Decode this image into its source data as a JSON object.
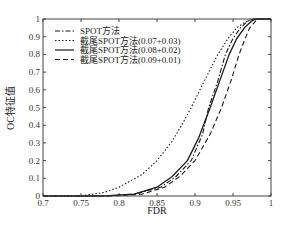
{
  "chart_data": {
    "type": "line",
    "title": "",
    "xlabel": "FDR",
    "ylabel": "OC特征值",
    "xlim": [
      0.7,
      1.0
    ],
    "ylim": [
      0,
      1
    ],
    "xticks": [
      "0.7",
      "0.75",
      "0.8",
      "0.85",
      "0.9",
      "0.95",
      "1"
    ],
    "yticks": [
      "0",
      "0.1",
      "0.2",
      "0.3",
      "0.4",
      "0.5",
      "0.6",
      "0.7",
      "0.8",
      "0.9",
      "1"
    ],
    "grid": false,
    "legend_position": "upper left",
    "series": [
      {
        "name": "SPOT方法",
        "style": "dashdot",
        "x": [
          0.7,
          0.78,
          0.82,
          0.855,
          0.875,
          0.895,
          0.91,
          0.918,
          0.93,
          0.94,
          0.95,
          0.96,
          0.97,
          0.978,
          1.0
        ],
        "y": [
          0.0,
          0.0,
          0.01,
          0.05,
          0.11,
          0.2,
          0.35,
          0.5,
          0.65,
          0.8,
          0.89,
          0.95,
          0.99,
          1.0,
          1.0
        ]
      },
      {
        "name": "截尾SPOT方法(0.07+0.03)",
        "style": "dotted",
        "x": [
          0.7,
          0.75,
          0.78,
          0.8,
          0.83,
          0.85,
          0.87,
          0.885,
          0.895,
          0.91,
          0.93,
          0.945,
          0.955,
          0.965,
          0.975,
          1.0
        ],
        "y": [
          0.0,
          0.0,
          0.02,
          0.05,
          0.12,
          0.2,
          0.31,
          0.42,
          0.5,
          0.63,
          0.8,
          0.9,
          0.95,
          0.98,
          1.0,
          1.0
        ]
      },
      {
        "name": "截尾SPOT方法(0.08+0.02)",
        "style": "solid",
        "x": [
          0.7,
          0.78,
          0.82,
          0.85,
          0.87,
          0.89,
          0.905,
          0.92,
          0.935,
          0.945,
          0.955,
          0.965,
          0.975,
          0.98,
          1.0
        ],
        "y": [
          0.0,
          0.0,
          0.01,
          0.05,
          0.11,
          0.2,
          0.33,
          0.5,
          0.68,
          0.8,
          0.89,
          0.95,
          0.99,
          1.0,
          1.0
        ]
      },
      {
        "name": "截尾SPOT方法(0.09+0.01)",
        "style": "dashed",
        "x": [
          0.7,
          0.79,
          0.83,
          0.86,
          0.88,
          0.9,
          0.92,
          0.935,
          0.948,
          0.958,
          0.966,
          0.972,
          0.98,
          0.985,
          1.0
        ],
        "y": [
          0.0,
          0.0,
          0.01,
          0.05,
          0.11,
          0.2,
          0.35,
          0.5,
          0.66,
          0.8,
          0.89,
          0.95,
          0.99,
          1.0,
          1.0
        ]
      }
    ]
  },
  "legend": {
    "items": [
      "SPOT方法",
      "截尾SPOT方法(0.07+0.03)",
      "截尾SPOT方法(0.08+0.02)",
      "截尾SPOT方法(0.09+0.01)"
    ]
  },
  "colors": {
    "line": "#1a1a1a",
    "axis": "#444444",
    "background": "#ffffff"
  }
}
